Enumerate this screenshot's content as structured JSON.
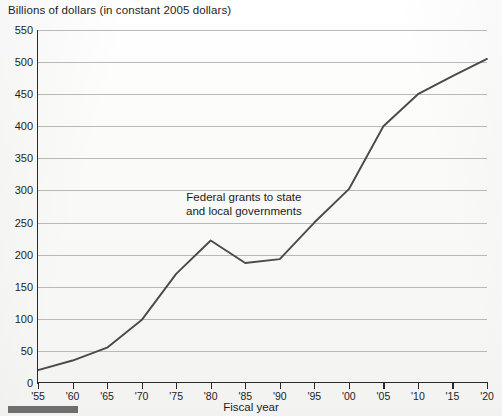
{
  "chart_data": {
    "type": "line",
    "title": "Billions of dollars (in constant 2005 dollars)",
    "xlabel": "Fiscal year",
    "ylabel": "",
    "annotation": "Federal grants to state\nand local governments",
    "grid": true,
    "legend": "none",
    "xlim": [
      1955,
      2020
    ],
    "ylim": [
      0,
      550
    ],
    "ytick_step": 50,
    "yticks": [
      0,
      50,
      100,
      150,
      200,
      250,
      300,
      350,
      400,
      450,
      500,
      550
    ],
    "ytick_labels": [
      "0",
      "50",
      "100",
      "150",
      "200",
      "250",
      "300",
      "350",
      "400",
      "450",
      "500",
      "550"
    ],
    "xticks": [
      1955,
      1960,
      1965,
      1970,
      1975,
      1980,
      1985,
      1990,
      1995,
      2000,
      2005,
      2010,
      2015,
      2020
    ],
    "xtick_labels": [
      "'55",
      "'60",
      "'65",
      "'70",
      "'75",
      "'80",
      "'85",
      "'90",
      "'95",
      "'00",
      "'05",
      "'10",
      "'15",
      "'20"
    ],
    "categories": [
      "'55",
      "'60",
      "'65",
      "'70",
      "'75",
      "'80",
      "'85",
      "'90",
      "'95",
      "'00",
      "'05",
      "'10",
      "'15",
      "'20"
    ],
    "x": [
      1955,
      1960,
      1965,
      1970,
      1975,
      1980,
      1985,
      1990,
      1995,
      2000,
      2005,
      2010,
      2015,
      2020
    ],
    "values": [
      20,
      35,
      55,
      98,
      170,
      222,
      187,
      193,
      250,
      302,
      400,
      450,
      478,
      505
    ],
    "series": [
      {
        "name": "Federal grants to state and local governments",
        "values": [
          20,
          35,
          55,
          98,
          170,
          222,
          187,
          193,
          250,
          302,
          400,
          450,
          478,
          505
        ]
      }
    ]
  },
  "colors": {
    "line": "#4a4a4a",
    "grid": "#b9b9b9",
    "axis": "#2a2a2a",
    "text": "#1d1d1d",
    "background": "#fbfbfa",
    "bottom_bar": "#6e6e6e"
  }
}
